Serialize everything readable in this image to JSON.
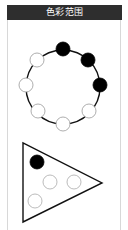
{
  "header": {
    "title": "色彩范围"
  },
  "colors": {
    "header_bg": "#2e2e2e",
    "filled": "#000000",
    "empty": "#ffffff",
    "ring_stroke": "#111111",
    "triangle_circle_stroke": "#aaaaaa"
  },
  "ring_figure": {
    "shape": "circle-ring",
    "center": [
      63,
      87
    ],
    "radius": 37,
    "dot_radius": 7,
    "dots": [
      {
        "position": "top",
        "x": 63,
        "y": 49,
        "state": "filled"
      },
      {
        "position": "upper-right",
        "x": 88,
        "y": 60,
        "state": "filled"
      },
      {
        "position": "right",
        "x": 100,
        "y": 85,
        "state": "filled"
      },
      {
        "position": "lower-right",
        "x": 89,
        "y": 111,
        "state": "empty"
      },
      {
        "position": "bottom",
        "x": 63,
        "y": 124,
        "state": "empty"
      },
      {
        "position": "lower-left",
        "x": 38,
        "y": 111,
        "state": "empty"
      },
      {
        "position": "left",
        "x": 26,
        "y": 85,
        "state": "empty"
      },
      {
        "position": "upper-left",
        "x": 37,
        "y": 60,
        "state": "empty"
      }
    ]
  },
  "triangle_figure": {
    "shape": "triangle",
    "vertices": [
      [
        23,
        143
      ],
      [
        23,
        222
      ],
      [
        102,
        183
      ]
    ],
    "dot_radius": 7,
    "dots": [
      {
        "x": 37,
        "y": 162,
        "state": "filled"
      },
      {
        "x": 50,
        "y": 182,
        "state": "empty"
      },
      {
        "x": 74,
        "y": 182,
        "state": "empty"
      },
      {
        "x": 35,
        "y": 201,
        "state": "empty"
      }
    ]
  }
}
